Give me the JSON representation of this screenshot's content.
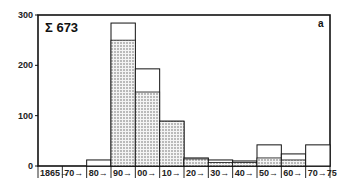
{
  "chart_data": {
    "type": "bar",
    "subtype": "stacked-histogram",
    "title": "Σ 673",
    "panel_label": "a",
    "xlabel": "",
    "ylabel": "",
    "ylim": [
      0,
      300
    ],
    "yticks": [
      0,
      100,
      200,
      300
    ],
    "grid": false,
    "legend": "none",
    "categories": [
      "1865→",
      "70→",
      "80→",
      "90→",
      "00→",
      "10→",
      "20→",
      "30→",
      "40→",
      "50→",
      "60→",
      "70→75"
    ],
    "series": [
      {
        "name": "stippled",
        "pattern": "dots",
        "values": [
          0,
          0,
          0,
          250,
          147,
          89,
          14,
          7,
          7,
          16,
          12,
          0
        ]
      },
      {
        "name": "total",
        "pattern": "open",
        "values": [
          0,
          0,
          12,
          284,
          193,
          89,
          16,
          12,
          10,
          42,
          24,
          42
        ]
      }
    ]
  },
  "labels": {
    "title": "Σ 673",
    "panel": "a"
  }
}
